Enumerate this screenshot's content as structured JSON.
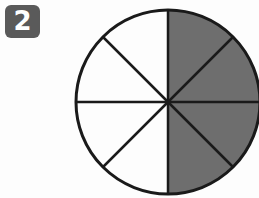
{
  "badge": {
    "number": "2"
  },
  "diagram": {
    "type": "fraction-circle",
    "total_parts": 8,
    "shaded_parts": 4,
    "shaded_color": "#6e6e6e",
    "unshaded_color": "#ffffff",
    "outline_color": "#1a1a1a"
  }
}
